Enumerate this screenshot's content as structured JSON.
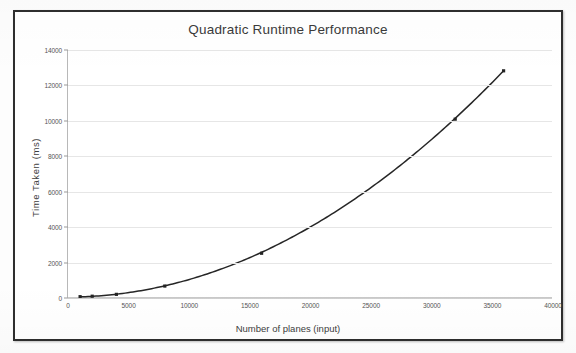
{
  "chart_data": {
    "type": "line",
    "title": "Quadratic Runtime Performance",
    "xlabel": "Number of planes (input)",
    "ylabel": "Time Taken (ms)",
    "xlim": [
      0,
      40000
    ],
    "ylim": [
      0,
      14000
    ],
    "xticks": [
      "0",
      "5000",
      "10000",
      "15000",
      "20000",
      "25000",
      "30000",
      "35000",
      "40000"
    ],
    "xtick_values": [
      0,
      5000,
      10000,
      15000,
      20000,
      25000,
      30000,
      35000,
      40000
    ],
    "yticks": [
      "0",
      "2000",
      "4000",
      "6000",
      "8000",
      "10000",
      "12000",
      "14000"
    ],
    "ytick_values": [
      0,
      2000,
      4000,
      6000,
      8000,
      10000,
      12000,
      14000
    ],
    "grid": "horizontal",
    "legend": "none",
    "series": [
      {
        "name": "Time Taken (ms)",
        "color": "#262626",
        "marker": "square",
        "x": [
          1000,
          2000,
          4000,
          8000,
          16000,
          32000,
          36000
        ],
        "y": [
          20,
          45,
          150,
          620,
          2480,
          10080,
          12820
        ]
      }
    ]
  },
  "chart": {
    "title": "Quadratic Runtime Performance",
    "xaxis_title": "Number of planes (input)",
    "yaxis_title": "Time Taken (ms)"
  }
}
